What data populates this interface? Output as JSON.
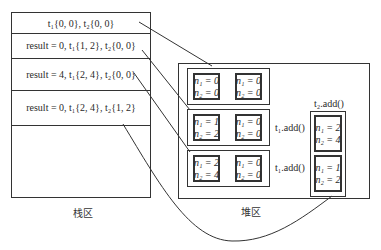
{
  "stack": {
    "caption": "栈区",
    "rows": [
      "t₁{0, 0}, t₂{0, 0}",
      "result = 0, t₁{1, 2}, t₂{0, 0}",
      "result = 4, t₁{2, 4}, t₂{0, 0}",
      "result = 0, t₁{2, 4}, t₂{1, 2}"
    ]
  },
  "heap": {
    "caption": "堆区",
    "rows": [
      {
        "left": [
          "n₁ = 0",
          "n₂ = 0"
        ],
        "right": [
          "n₁ = 0",
          "n₂ = 0"
        ],
        "label": ""
      },
      {
        "left": [
          "n₁ = 1",
          "n₂ = 2"
        ],
        "right": [
          "n₁ = 0",
          "n₂ = 0"
        ],
        "label": "t₁.add()"
      },
      {
        "left": [
          "n₁ = 2",
          "n₂ = 4"
        ],
        "right": [
          "n₁ = 0",
          "n₂ = 0"
        ],
        "label": "t₁.add()"
      }
    ],
    "t2_column": {
      "label": "t₂.add()",
      "top": [
        "n₁ = 2",
        "n₂ = 4"
      ],
      "bottom": [
        "n₁ = 1",
        "n₂ = 2"
      ]
    }
  }
}
